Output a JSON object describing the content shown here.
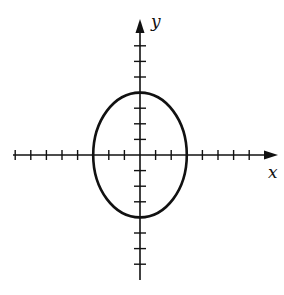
{
  "diagram": {
    "type": "ellipse-on-axes",
    "x_axis_label": "x",
    "y_axis_label": "y",
    "tick_spacing_units": 1,
    "x_ticks": [
      -8,
      -7,
      -6,
      -5,
      -4,
      -3,
      -2,
      -1,
      1,
      2,
      3,
      4,
      5,
      6,
      7
    ],
    "y_ticks": [
      7,
      6,
      5,
      4,
      3,
      2,
      1,
      -1,
      -2,
      -3,
      -4,
      -5,
      -6,
      -7
    ],
    "ellipse": {
      "center": [
        0,
        0
      ],
      "semi_axis_x": 3,
      "semi_axis_y": 4
    },
    "colors": {
      "stroke": "#111111",
      "background": "#ffffff"
    }
  }
}
